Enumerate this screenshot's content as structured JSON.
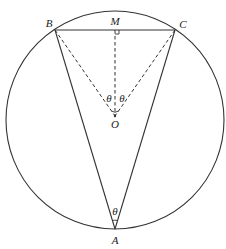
{
  "diagram": {
    "type": "geometry",
    "circle": {
      "center_label": "O",
      "cx": 115,
      "cy": 120,
      "r": 109
    },
    "points": {
      "A": {
        "label": "A",
        "x": 115,
        "y": 229
      },
      "B": {
        "label": "B",
        "x": 55,
        "y": 30
      },
      "C": {
        "label": "C",
        "x": 175,
        "y": 30
      },
      "M": {
        "label": "M",
        "x": 115,
        "y": 30
      },
      "O": {
        "label": "O",
        "x": 115,
        "y": 116
      }
    },
    "solid_segments": [
      "AB",
      "AC",
      "BC"
    ],
    "dashed_segments": [
      "OB",
      "OC",
      "OM"
    ],
    "angle_labels": {
      "left_at_O": "θ",
      "right_at_O": "θ",
      "at_A": "θ"
    },
    "right_angle_marker": "M",
    "colors": {
      "line": "#333333",
      "background": "#ffffff"
    }
  }
}
